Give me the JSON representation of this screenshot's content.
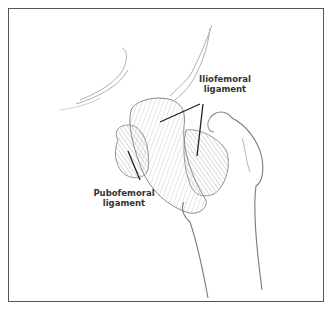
{
  "figure": {
    "labels": {
      "iliofemoral": {
        "line1": "Iliofemoral",
        "line2": "ligament"
      },
      "pubofemoral": {
        "line1": "Pubofemoral",
        "line2": "ligament"
      }
    },
    "colors": {
      "frame": "#555555",
      "background": "#ffffff",
      "label_text": "#333333",
      "leader_line": "#222222",
      "sketch": "#8a8a8a"
    }
  }
}
